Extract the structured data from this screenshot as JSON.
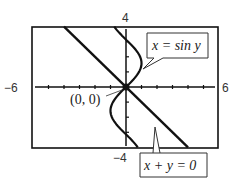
{
  "chart_data": {
    "type": "line",
    "title": "",
    "xlabel": "",
    "ylabel": "",
    "xlim": [
      -6,
      6
    ],
    "ylim": [
      -4,
      4
    ],
    "grid": false,
    "tick_labels": {
      "xmin": "−6",
      "xmax": "6",
      "ymax": "4",
      "ymin": "−4"
    },
    "series": [
      {
        "name": "x = sin y",
        "type": "parametric",
        "equation": "x = sin y",
        "y_range": [
          -4,
          4
        ]
      },
      {
        "name": "x + y = 0",
        "type": "line",
        "equation": "x + y = 0",
        "x_range": [
          -4,
          4
        ]
      }
    ],
    "annotations": [
      {
        "text": "(0, 0)",
        "point": [
          0,
          0
        ]
      },
      {
        "text": "x = sin y",
        "callout_to": "curve x = sin y"
      },
      {
        "text": "x + y = 0",
        "callout_to": "line x + y = 0"
      }
    ],
    "intersection_point": [
      0,
      0
    ]
  }
}
